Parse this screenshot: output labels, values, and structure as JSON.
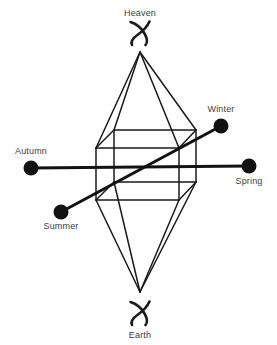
{
  "figure": {
    "type": "cosmological-diagram",
    "background_color": "#ffffff",
    "line_color": "#1a1a1a",
    "label_color": "#3d3d3d"
  },
  "poles": {
    "top": {
      "label": "Heaven",
      "glyph_name": "swirl-cross-glyph",
      "label_x": 140,
      "label_y": 16,
      "glyph_cx": 140,
      "glyph_cy": 33,
      "apex_x": 140,
      "apex_y": 52
    },
    "bottom": {
      "label": "Earth",
      "glyph_name": "swirl-cross-glyph",
      "label_x": 140,
      "label_y": 338,
      "glyph_cx": 140,
      "glyph_cy": 313,
      "apex_x": 140,
      "apex_y": 292
    }
  },
  "axes": [
    {
      "name": "autumn-spring-axis",
      "orientation": "horizontal",
      "start": {
        "label": "Autumn",
        "dot_x": 31,
        "dot_y": 168,
        "dot_r": 7.5,
        "label_x": 31,
        "label_y": 154,
        "anchor": "middle"
      },
      "end": {
        "label": "Spring",
        "dot_x": 249,
        "dot_y": 166,
        "dot_r": 7.5,
        "label_x": 249,
        "label_y": 184,
        "anchor": "middle"
      }
    },
    {
      "name": "summer-winter-axis",
      "orientation": "diagonal",
      "start": {
        "label": "Summer",
        "dot_x": 61,
        "dot_y": 212,
        "dot_r": 7.5,
        "label_x": 61,
        "label_y": 229,
        "anchor": "middle"
      },
      "end": {
        "label": "Winter",
        "dot_x": 221,
        "dot_y": 126,
        "dot_r": 7.5,
        "label_x": 221,
        "label_y": 112,
        "anchor": "middle"
      }
    }
  ],
  "cube": {
    "projection": "oblique",
    "front_face": {
      "left": 96,
      "right": 179,
      "top": 148,
      "bottom": 200
    },
    "back_face": {
      "left": 114,
      "right": 196,
      "top": 130,
      "bottom": 182
    },
    "vertices": {
      "front_top_left": [
        96,
        148
      ],
      "front_top_right": [
        179,
        148
      ],
      "front_bottom_right": [
        179,
        200
      ],
      "front_bottom_left": [
        96,
        200
      ],
      "back_top_left": [
        114,
        130
      ],
      "back_top_right": [
        196,
        130
      ],
      "back_bottom_right": [
        196,
        182
      ],
      "back_bottom_left": [
        114,
        182
      ]
    }
  },
  "labels_list": [
    "Heaven",
    "Winter",
    "Autumn",
    "Spring",
    "Summer",
    "Earth"
  ]
}
